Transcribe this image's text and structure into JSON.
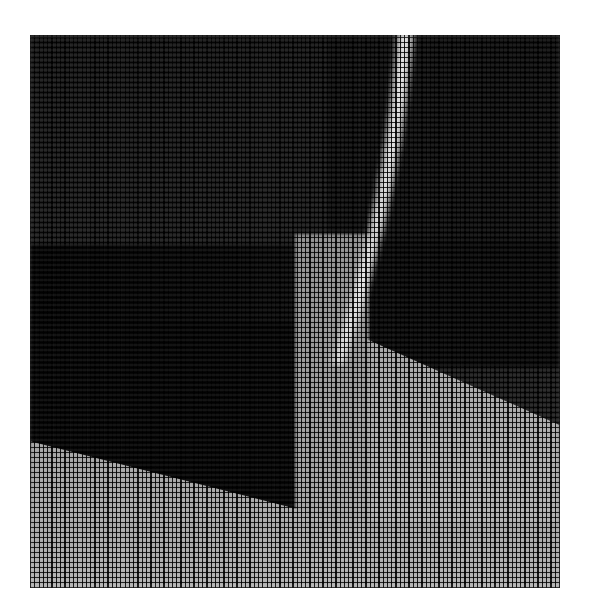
{
  "canvas": {
    "width": 590,
    "height": 616,
    "background_color": "#ffffff",
    "title": "Halftone woven-screen greyscale image"
  },
  "plate": {
    "left": 30,
    "top": 35,
    "width": 530,
    "height": 553,
    "description": "Greyscale photograph reproduced through a fine woven halftone screen",
    "screen": {
      "type": "woven-grid",
      "warp_pitch_px": 4.3,
      "weft_pitch_px": 5.0,
      "warp_line_px": 1.2,
      "weft_line_px": 1.3,
      "ink_color": "#000000"
    }
  },
  "tones": {
    "black": "#000000",
    "deep_shadow": "#070707",
    "dark_wall": "#131313",
    "mid_dark": "#242424",
    "mid_grey": "#8e8e8e",
    "light_floor": "#b4b4b4",
    "highlight": "#ffffff",
    "paper": "#ffffff"
  },
  "regions": [
    {
      "name": "dark-wall",
      "tone": "#131313",
      "note": "large dark field filling most of the frame"
    },
    {
      "name": "upper-left-panel",
      "tone": "#191919",
      "note": "slightly lighter dark band, top left"
    },
    {
      "name": "shadow-block",
      "tone": "#070707",
      "note": "deep black block, lower left quadrant"
    },
    {
      "name": "right-panel",
      "tone": "#121212",
      "note": "dark panel right of the streak, faint horizontal seam"
    },
    {
      "name": "right-panel-lower",
      "tone": "#0c0c0c",
      "note": "darker continuation below the seam"
    },
    {
      "name": "floor-right",
      "tone": "#a8a8a8",
      "note": "bright ground plane, right half, diagonal top edge rising to the right"
    },
    {
      "name": "floor-left",
      "tone": "#a8a8a8",
      "note": "bright ground plane, left, diagonal top edge rising to the right"
    },
    {
      "name": "floor-mid",
      "tone": "#9a9a9a",
      "note": "bright vertical column of ground below the streak"
    },
    {
      "name": "floor-bottom-band",
      "tone": "#b2b2b2",
      "note": "brightest band along the bottom edge"
    }
  ],
  "streak": {
    "name": "bright-vertical-streak",
    "note": "narrow near-vertical highlight running from the top edge down past mid-frame, leaning slightly left as it descends",
    "color": "#ffffff",
    "top_x_px": 405,
    "bottom_x_px": 338,
    "top_y_px": 35,
    "bottom_y_px": 360,
    "width_px": 22
  },
  "edges": [
    {
      "name": "floor-edge-left",
      "from": [
        30,
        448
      ],
      "to": [
        300,
        492
      ],
      "note": "diagonal light/dark boundary, lower left"
    },
    {
      "name": "floor-edge-right",
      "from": [
        340,
        352
      ],
      "to": [
        560,
        430
      ],
      "note": "diagonal light/dark boundary, right of streak"
    },
    {
      "name": "seam-right",
      "from": [
        400,
        238
      ],
      "to": [
        560,
        238
      ],
      "note": "faint horizontal tonal seam, upper right"
    }
  ]
}
